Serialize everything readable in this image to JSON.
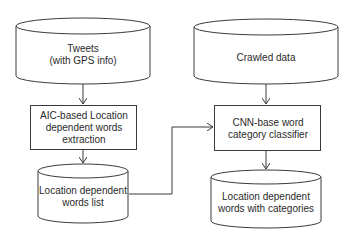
{
  "nodes": {
    "tweets": {
      "type": "datastore",
      "line1": "Tweets",
      "line2": "(with GPS info)"
    },
    "crawled": {
      "type": "datastore",
      "line1": "Crawled data"
    },
    "aic": {
      "type": "process",
      "line1": "AIC-based Location",
      "line2": "dependent words",
      "line3": "extraction"
    },
    "cnn": {
      "type": "process",
      "line1": "CNN-base word",
      "line2": "category classifier"
    },
    "loclist": {
      "type": "datastore",
      "line1": "Location dependent",
      "line2": "words list"
    },
    "loccat": {
      "type": "datastore",
      "line1": "Location dependent",
      "line2": "words with categories"
    }
  },
  "edges": [
    {
      "from": "tweets",
      "to": "aic"
    },
    {
      "from": "aic",
      "to": "loclist"
    },
    {
      "from": "loclist",
      "to": "cnn"
    },
    {
      "from": "crawled",
      "to": "cnn"
    },
    {
      "from": "cnn",
      "to": "loccat"
    }
  ],
  "colors": {
    "stroke": "#3a3a3a",
    "fill": "#ffffff",
    "text": "#2a2a2a"
  }
}
